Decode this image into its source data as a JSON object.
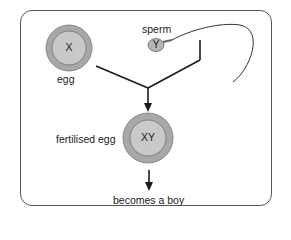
{
  "diagram": {
    "egg": {
      "label": "egg",
      "chromosome": "X"
    },
    "sperm": {
      "label": "sperm",
      "chromosome": "Y"
    },
    "fertilised_egg": {
      "label": "fertilised egg",
      "chromosome": "XY"
    },
    "outcome": {
      "label": "becomes a boy"
    }
  },
  "colors": {
    "cell_outer": "#a8a8a8",
    "cell_inner": "#c8c8c8",
    "line": "#1a1a1a",
    "frame": "#555555"
  }
}
